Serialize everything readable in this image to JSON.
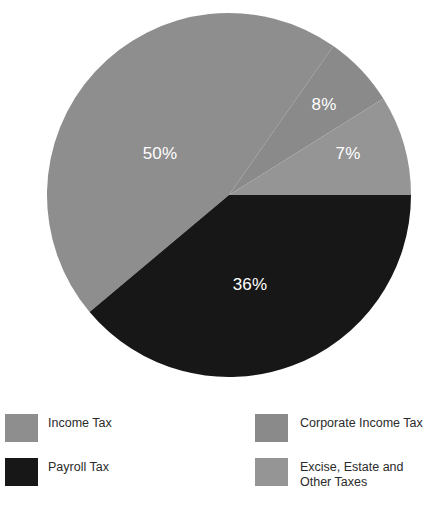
{
  "chart_data": {
    "type": "pie",
    "title": "",
    "subtitle": "",
    "xlabel": "",
    "ylabel": "",
    "grid": false,
    "legend_position": "bottom",
    "legend_columns": 2,
    "unit": "%",
    "categories": [
      "Income Tax",
      "Payroll Tax",
      "Corporate Income Tax",
      "Excise, Estate and Other Taxes"
    ],
    "values": [
      50,
      36,
      8,
      7
    ],
    "labels": [
      "50%",
      "36%",
      "8%",
      "7%"
    ],
    "colors": [
      "#8e8e8e",
      "#171717",
      "#8a8a8a",
      "#959595"
    ],
    "slices": [
      {
        "name": "Income Tax",
        "value": 50,
        "label": "50%",
        "color": "#8e8e8e",
        "start_deg": 230,
        "end_deg": 395,
        "label_x": 160,
        "label_y": 155
      },
      {
        "name": "Payroll Tax",
        "value": 36,
        "label": "36%",
        "color": "#171717",
        "start_deg": 90,
        "end_deg": 230,
        "label_x": 250,
        "label_y": 286
      },
      {
        "name": "Corporate Income Tax",
        "value": 8,
        "label": "8%",
        "color": "#8a8a8a",
        "start_deg": 35,
        "end_deg": 58,
        "label_x": 324,
        "label_y": 106
      },
      {
        "name": "Excise, Estate and Other Taxes",
        "value": 7,
        "label": "7%",
        "color": "#959595",
        "start_deg": 58,
        "end_deg": 90,
        "label_x": 348,
        "label_y": 155
      }
    ],
    "geometry": {
      "center_x": 229,
      "center_y": 195,
      "radius": 182
    }
  },
  "legend": {
    "columns": [
      {
        "items": [
          {
            "label": "Income Tax",
            "color": "#8e8e8e"
          },
          {
            "label": "Payroll Tax",
            "color": "#171717"
          }
        ]
      },
      {
        "items": [
          {
            "label": "Corporate Income Tax",
            "color": "#8a8a8a"
          },
          {
            "label": "Excise, Estate and\nOther Taxes",
            "color": "#959595"
          }
        ]
      }
    ]
  }
}
